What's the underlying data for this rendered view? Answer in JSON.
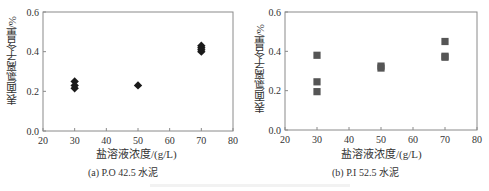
{
  "chart_data": [
    {
      "type": "scatter",
      "title": "",
      "caption": "(a) P.O 42.5 水泥",
      "xlabel": "盐溶液浓度/(g/L)",
      "ylabel": "表面氯离子含量/%",
      "xlim": [
        20,
        80
      ],
      "ylim": [
        0.0,
        0.6
      ],
      "xticks": [
        20,
        30,
        40,
        50,
        60,
        70,
        80
      ],
      "yticks": [
        "0.0",
        "0.2",
        "0.4",
        "0.6"
      ],
      "grid": false,
      "marker": "diamond",
      "color": "#1a1a1a",
      "points": [
        {
          "x": 30,
          "y": 0.25
        },
        {
          "x": 30,
          "y": 0.23
        },
        {
          "x": 30,
          "y": 0.215
        },
        {
          "x": 50,
          "y": 0.23
        },
        {
          "x": 70,
          "y": 0.43
        },
        {
          "x": 70,
          "y": 0.42
        },
        {
          "x": 70,
          "y": 0.41
        },
        {
          "x": 70,
          "y": 0.4
        }
      ]
    },
    {
      "type": "scatter",
      "title": "",
      "caption": "(b) P.I 52.5 水泥",
      "xlabel": "盐溶液浓度/(g/L)",
      "ylabel": "表面氯离子含量/%",
      "xlim": [
        20,
        80
      ],
      "ylim": [
        0.0,
        0.6
      ],
      "xticks": [
        20,
        30,
        40,
        50,
        60,
        70,
        80
      ],
      "yticks": [
        "0.0",
        "0.2",
        "0.4",
        "0.6"
      ],
      "grid": false,
      "marker": "square",
      "color": "#555555",
      "points": [
        {
          "x": 30,
          "y": 0.38
        },
        {
          "x": 30,
          "y": 0.245
        },
        {
          "x": 30,
          "y": 0.195
        },
        {
          "x": 50,
          "y": 0.325
        },
        {
          "x": 50,
          "y": 0.315
        },
        {
          "x": 70,
          "y": 0.45
        },
        {
          "x": 70,
          "y": 0.375
        },
        {
          "x": 70,
          "y": 0.37
        }
      ]
    }
  ]
}
